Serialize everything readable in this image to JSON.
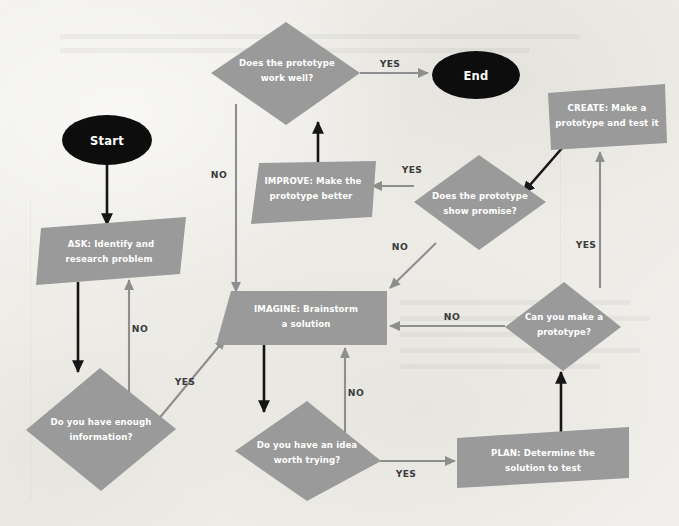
{
  "diagram": {
    "background_color": "#efeeea",
    "node_color": "#9a9a9a",
    "terminator_color": "#0d0d0d",
    "node_text_color": "#ffffff",
    "gray_edge_color": "#8e8e8e",
    "dark_edge_color": "#161616"
  },
  "nodes": {
    "start": {
      "label": "Start",
      "shape": "ellipse"
    },
    "end": {
      "label": "End",
      "shape": "ellipse"
    },
    "ask": {
      "line1": "ASK: Identify and",
      "line2": "research problem",
      "shape": "parallelogram"
    },
    "enough_info": {
      "line1": "Do you have enough",
      "line2": "information?",
      "shape": "diamond"
    },
    "imagine": {
      "line1": "IMAGINE: Brainstorm",
      "line2": "a solution",
      "shape": "parallelogram"
    },
    "idea_worth": {
      "line1": "Do you have an idea",
      "line2": "worth trying?",
      "shape": "diamond"
    },
    "plan": {
      "line1": "PLAN: Determine the",
      "line2": "solution to test",
      "shape": "parallelogram"
    },
    "can_prototype": {
      "line1": "Can you make a",
      "line2": "prototype?",
      "shape": "diamond"
    },
    "create": {
      "line1": "CREATE: Make a",
      "line2": "prototype and test it",
      "shape": "parallelogram"
    },
    "show_promise": {
      "line1": "Does the prototype",
      "line2": "show promise?",
      "shape": "diamond"
    },
    "improve": {
      "line1": "IMPROVE: Make the",
      "line2": "prototype better",
      "shape": "parallelogram"
    },
    "work_well": {
      "line1": "Does the prototype",
      "line2": "work well?",
      "shape": "diamond"
    }
  },
  "edge_labels": {
    "work_well_yes": "YES",
    "work_well_no": "NO",
    "enough_info_no": "NO",
    "enough_info_yes": "YES",
    "idea_worth_no": "NO",
    "idea_worth_yes": "YES",
    "can_prototype_no": "NO",
    "can_prototype_yes": "YES",
    "show_promise_no": "NO",
    "show_promise_yes": "YES"
  }
}
